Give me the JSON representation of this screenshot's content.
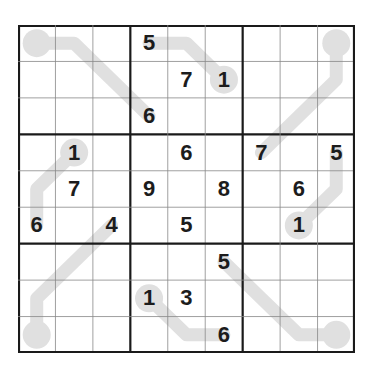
{
  "puzzle": {
    "type": "sudoku-lines",
    "size": 9,
    "colors": {
      "line": "#e0e0e0",
      "grid_thin": "#888888",
      "grid_thick": "#1a1a1a",
      "digit": "#1c1c1c"
    },
    "grid": [
      [
        "",
        "",
        "",
        "5",
        "",
        "",
        "",
        "",
        ""
      ],
      [
        "",
        "",
        "",
        "",
        "7",
        "1",
        "",
        "",
        ""
      ],
      [
        "",
        "",
        "",
        "6",
        "",
        "",
        "",
        "",
        ""
      ],
      [
        "",
        "1",
        "",
        "",
        "6",
        "",
        "7",
        "",
        "5"
      ],
      [
        "",
        "7",
        "",
        "9",
        "",
        "8",
        "",
        "6",
        ""
      ],
      [
        "6",
        "",
        "4",
        "",
        "5",
        "",
        "",
        "1",
        ""
      ],
      [
        "",
        "",
        "",
        "",
        "",
        "5",
        "",
        "",
        ""
      ],
      [
        "",
        "",
        "",
        "1",
        "3",
        "",
        "",
        "",
        ""
      ],
      [
        "",
        "",
        "",
        "",
        "",
        "6",
        "",
        "",
        ""
      ]
    ],
    "lines": [
      {
        "bulb": [
          0,
          0
        ],
        "path": [
          [
            0,
            0
          ],
          [
            0,
            1
          ],
          [
            1,
            2
          ],
          [
            2,
            3
          ]
        ]
      },
      {
        "bulb": [
          1,
          5
        ],
        "path": [
          [
            1,
            5
          ],
          [
            0,
            4
          ],
          [
            0,
            3
          ]
        ]
      },
      {
        "bulb": [
          0,
          8
        ],
        "path": [
          [
            0,
            8
          ],
          [
            1,
            8
          ],
          [
            2,
            7
          ],
          [
            3,
            6
          ]
        ]
      },
      {
        "bulb": [
          3,
          1
        ],
        "path": [
          [
            3,
            1
          ],
          [
            4,
            0
          ],
          [
            5,
            0
          ]
        ]
      },
      {
        "bulb": [
          5,
          7
        ],
        "path": [
          [
            5,
            7
          ],
          [
            4,
            8
          ],
          [
            3,
            8
          ]
        ]
      },
      {
        "bulb": [
          8,
          0
        ],
        "path": [
          [
            8,
            0
          ],
          [
            7,
            0
          ],
          [
            6,
            1
          ],
          [
            5,
            2
          ]
        ]
      },
      {
        "bulb": [
          7,
          3
        ],
        "path": [
          [
            7,
            3
          ],
          [
            8,
            4
          ],
          [
            8,
            5
          ]
        ]
      },
      {
        "bulb": [
          8,
          8
        ],
        "path": [
          [
            8,
            8
          ],
          [
            8,
            7
          ],
          [
            7,
            6
          ],
          [
            6,
            5
          ]
        ]
      }
    ]
  }
}
